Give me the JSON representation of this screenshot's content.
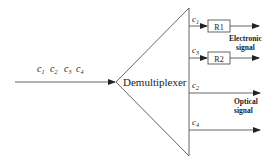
{
  "diagram": {
    "title": "Demultiplexer",
    "input": {
      "channels": [
        "c",
        "c",
        "c",
        "c"
      ],
      "subscripts": [
        "1",
        "2",
        "3",
        "4"
      ]
    },
    "outputs": [
      {
        "channel": "c",
        "subscript": "1",
        "receiver": "R1",
        "y": 26
      },
      {
        "channel": "c",
        "subscript": "3",
        "receiver": "R2",
        "y": 58
      },
      {
        "channel": "c",
        "subscript": "2",
        "receiver": null,
        "y": 92
      },
      {
        "channel": "c",
        "subscript": "4",
        "receiver": null,
        "y": 130
      }
    ],
    "labels": {
      "electronic_line1": "Electronic",
      "electronic_line2": "signal",
      "optical_line1": "Optical",
      "optical_line2": "signal"
    },
    "colors": {
      "line": "#555555",
      "text": "#222222",
      "background": "#ffffff"
    }
  }
}
